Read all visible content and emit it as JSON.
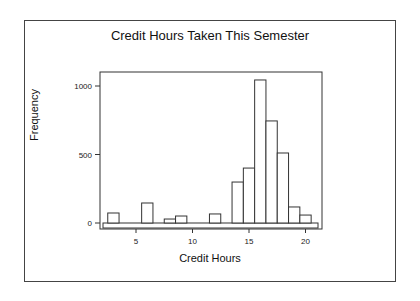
{
  "chart_data": {
    "type": "bar",
    "title": "Credit Hours Taken This Semester",
    "xlabel": "Credit Hours",
    "ylabel": "Frequency",
    "categories": [
      3,
      6,
      8,
      9,
      12,
      14,
      15,
      16,
      17,
      18,
      19,
      20
    ],
    "values": [
      73,
      146,
      29,
      51,
      66,
      299,
      401,
      1044,
      745,
      511,
      117,
      58
    ],
    "xticks": [
      5,
      10,
      15,
      20
    ],
    "yticks": [
      0,
      500,
      1000
    ],
    "xlim": [
      2,
      21
    ],
    "ylim": [
      0,
      1100
    ],
    "grid": false,
    "legend": null
  }
}
